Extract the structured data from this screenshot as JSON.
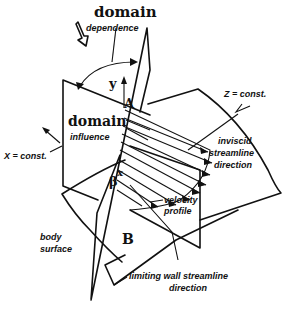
{
  "diagram": {
    "labels": {
      "domain_top": "domain",
      "dependence": "dependence",
      "domain_mid": "domain",
      "influence": "influence",
      "z_const": "Z = const.",
      "x_const": "X = const.",
      "y_axis": "y",
      "x_axis": "x",
      "beta": "β",
      "point_a": "A",
      "point_b": "B",
      "inviscid_1": "inviscid",
      "inviscid_2": "streamline",
      "inviscid_3": "direction",
      "velocity_1": "velocity",
      "velocity_2": "profile",
      "body_1": "body",
      "body_2": "surface",
      "limiting_1": "limiting wall streamline",
      "limiting_2": "direction"
    },
    "colors": {
      "ink": "#111111",
      "background": "#ffffff"
    }
  }
}
